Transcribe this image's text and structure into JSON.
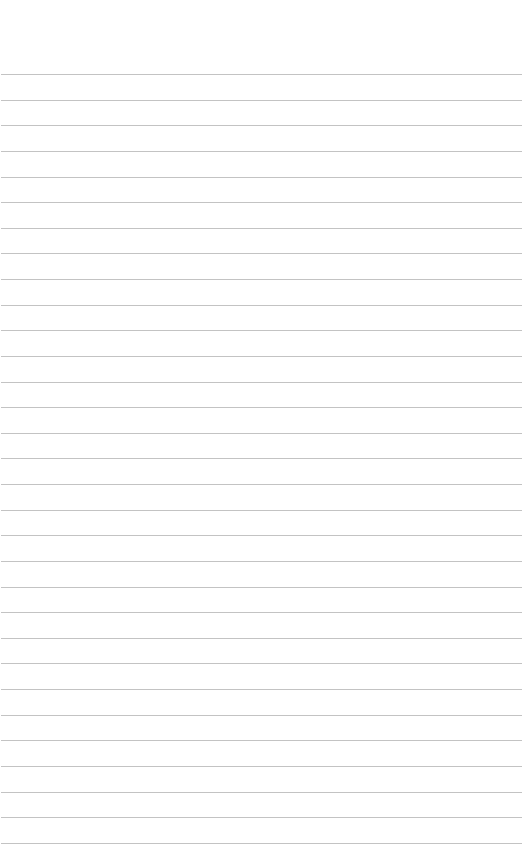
{
  "paper": {
    "type": "lined-paper",
    "background": "#ffffff",
    "rule_color": "#b8b8b8",
    "first_rule_y": 74,
    "rule_spacing": 25.63,
    "rule_count": 31
  }
}
